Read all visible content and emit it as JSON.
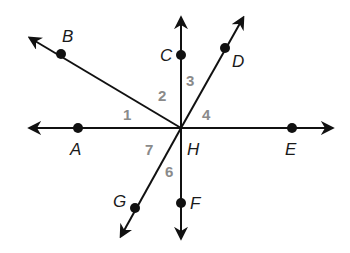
{
  "diagram": {
    "type": "intersecting-lines-and-rays",
    "vertex": {
      "label": "H",
      "x": 181,
      "y": 128
    },
    "points": {
      "A": {
        "label": "A",
        "x": 78,
        "y": 128,
        "label_x": 70,
        "label_y": 155
      },
      "B": {
        "label": "B",
        "x": 61,
        "y": 54,
        "label_x": 62,
        "label_y": 42
      },
      "C": {
        "label": "C",
        "x": 181,
        "y": 55,
        "label_x": 160,
        "label_y": 61
      },
      "D": {
        "label": "D",
        "x": 225,
        "y": 48,
        "label_x": 232,
        "label_y": 67
      },
      "E": {
        "label": "E",
        "x": 292,
        "y": 128,
        "label_x": 285,
        "label_y": 155
      },
      "F": {
        "label": "F",
        "x": 181,
        "y": 203,
        "label_x": 190,
        "label_y": 209
      },
      "G": {
        "label": "G",
        "x": 135,
        "y": 208,
        "label_x": 113,
        "label_y": 207
      },
      "H": {
        "label": "H",
        "label_x": 187,
        "label_y": 155
      }
    },
    "angles": [
      {
        "label": "1",
        "x": 128,
        "y": 120
      },
      {
        "label": "2",
        "x": 160,
        "y": 101
      },
      {
        "label": "3",
        "x": 187,
        "y": 86
      },
      {
        "label": "4",
        "x": 202,
        "y": 120
      },
      {
        "label": "7",
        "x": 144,
        "y": 155
      },
      {
        "label": "6",
        "x": 165,
        "y": 176
      }
    ],
    "colors": {
      "line": "#111111",
      "point_label": "#1a1a1a",
      "angle_label": "#8a8a8a",
      "background": "#ffffff"
    }
  }
}
